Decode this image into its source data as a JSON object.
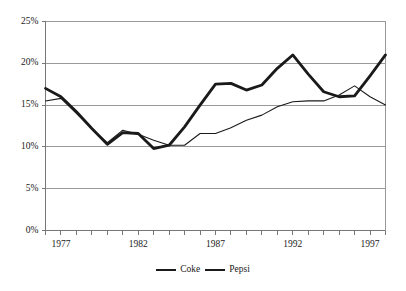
{
  "chart_data": {
    "type": "line",
    "title": "",
    "subtitle": "",
    "xlabel": "",
    "ylabel": "",
    "xlim": [
      1976,
      1998
    ],
    "ylim": [
      0,
      25
    ],
    "grid": true,
    "grid_axis": "y",
    "legend_position": "bottom-center",
    "y_ticks": [
      0,
      5,
      10,
      15,
      20,
      25
    ],
    "y_tick_labels": [
      "0%",
      "5%",
      "10%",
      "15%",
      "20%",
      "25%"
    ],
    "x_ticks_major": [
      1977,
      1982,
      1987,
      1992,
      1997
    ],
    "x_tick_labels": [
      "1977",
      "1982",
      "1987",
      "1992",
      "1997"
    ],
    "x_minor_tick_years": [
      1976,
      1977,
      1978,
      1979,
      1980,
      1981,
      1982,
      1983,
      1984,
      1985,
      1986,
      1987,
      1988,
      1989,
      1990,
      1991,
      1992,
      1993,
      1994,
      1995,
      1996,
      1997,
      1998
    ],
    "x": [
      1976,
      1977,
      1978,
      1979,
      1980,
      1981,
      1982,
      1983,
      1984,
      1985,
      1986,
      1987,
      1988,
      1989,
      1990,
      1991,
      1992,
      1993,
      1994,
      1995,
      1996,
      1997,
      1998
    ],
    "series": [
      {
        "name": "Coke",
        "color": "#1a1a1a",
        "line_width": 2.8,
        "values": [
          17.0,
          16.0,
          14.2,
          12.2,
          10.3,
          11.7,
          11.6,
          9.8,
          10.2,
          12.4,
          15.0,
          17.5,
          17.6,
          16.8,
          17.4,
          19.4,
          21.0,
          18.7,
          16.6,
          16.0,
          16.1,
          18.5,
          21.0
        ]
      },
      {
        "name": "Pepsi",
        "color": "#1a1a1a",
        "line_width": 1.1,
        "values": [
          15.5,
          15.8,
          14.0,
          12.2,
          10.5,
          12.0,
          11.5,
          10.8,
          10.2,
          10.2,
          11.6,
          11.6,
          12.3,
          13.2,
          13.8,
          14.8,
          15.4,
          15.5,
          15.5,
          16.2,
          17.3,
          16.0,
          15.0
        ]
      }
    ]
  },
  "legend": {
    "coke_label": "Coke",
    "pepsi_label": "Pepsi"
  }
}
